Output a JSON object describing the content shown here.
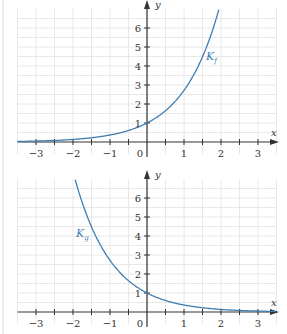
{
  "chart_data": [
    {
      "type": "line",
      "title": "",
      "xlabel": "x",
      "ylabel": "y",
      "xlim": [
        -3.5,
        3.5
      ],
      "ylim": [
        0,
        7
      ],
      "grid": true,
      "x_ticks": [
        "−3",
        "−2",
        "−1",
        "0",
        "1",
        "2",
        "3"
      ],
      "y_ticks": [
        "1",
        "2",
        "3",
        "4",
        "5",
        "6"
      ],
      "series": [
        {
          "name": "K_f",
          "label_main": "K",
          "label_sub": "f",
          "function": "e^x",
          "x": [
            -3.5,
            -3,
            -2,
            -1,
            0,
            1,
            1.5,
            1.95
          ],
          "values": [
            0.03,
            0.05,
            0.14,
            0.37,
            1,
            2.72,
            4.48,
            7.0
          ]
        }
      ]
    },
    {
      "type": "line",
      "title": "",
      "xlabel": "x",
      "ylabel": "y",
      "xlim": [
        -3.5,
        3.5
      ],
      "ylim": [
        0,
        7
      ],
      "grid": true,
      "x_ticks": [
        "−3",
        "−2",
        "−1",
        "0",
        "1",
        "2",
        "3"
      ],
      "y_ticks": [
        "1",
        "2",
        "3",
        "4",
        "5",
        "6"
      ],
      "series": [
        {
          "name": "K_g",
          "label_main": "K",
          "label_sub": "g",
          "function": "e^(-x)",
          "x": [
            -1.95,
            -1.5,
            -1,
            0,
            1,
            2,
            3,
            3.5
          ],
          "values": [
            7.0,
            4.48,
            2.72,
            1,
            0.37,
            0.14,
            0.05,
            0.03
          ]
        }
      ]
    }
  ],
  "colors": {
    "curve": "#3f7cb0",
    "axis": "#333333",
    "grid": "#e2e2e2"
  }
}
